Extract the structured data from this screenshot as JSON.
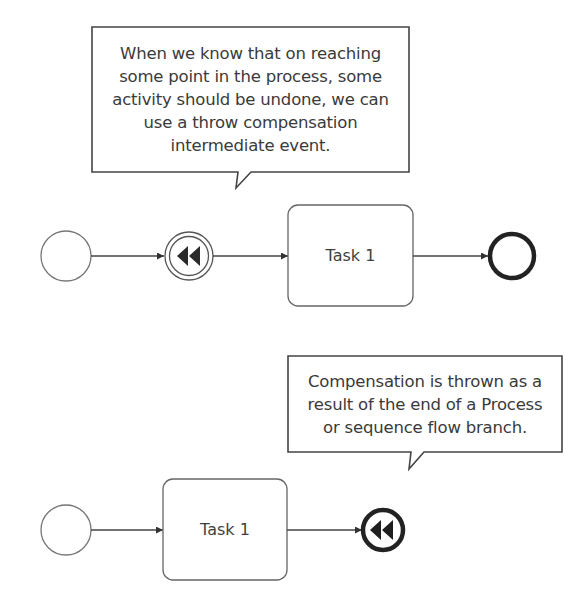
{
  "diagram": {
    "colors": {
      "stroke": "#333333",
      "light_stroke": "#777777",
      "text": "#3a3a3a",
      "background": "#ffffff"
    },
    "top_process": {
      "callout": {
        "lines": [
          "When we know that on reaching",
          "some point in the process, some",
          "activity should be undone, we can",
          "use a throw compensation",
          "intermediate event."
        ]
      },
      "start_event": {
        "type": "start-event",
        "label": ""
      },
      "intermediate_event": {
        "type": "throw-compensation-intermediate-event",
        "icon": "rewind-icon"
      },
      "task": {
        "label": "Task 1"
      },
      "end_event": {
        "type": "none-end-event",
        "label": ""
      }
    },
    "bottom_process": {
      "callout": {
        "lines": [
          "Compensation is thrown as a",
          "result of the end of a Process",
          "or sequence flow branch."
        ]
      },
      "start_event": {
        "type": "start-event",
        "label": ""
      },
      "task": {
        "label": "Task 1"
      },
      "end_event": {
        "type": "compensation-end-event",
        "icon": "rewind-icon"
      }
    }
  }
}
